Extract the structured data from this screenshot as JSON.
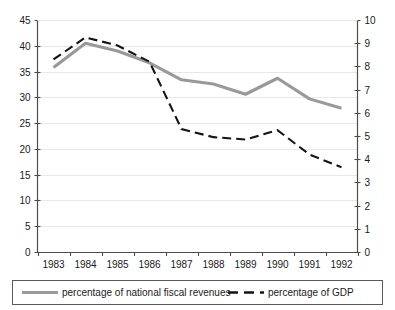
{
  "chart_data": {
    "type": "line",
    "title": "",
    "subtitle": "",
    "xlabel": "",
    "ylabel": "",
    "categories": [
      "1983",
      "1984",
      "1985",
      "1986",
      "1987",
      "1988",
      "1989",
      "1990",
      "1991",
      "1992"
    ],
    "grid": true,
    "legend_position": "bottom",
    "axes": {
      "left": {
        "label": "",
        "ylim": [
          0,
          45
        ],
        "tick_step": 5,
        "ticks": [
          "0",
          "5",
          "10",
          "15",
          "20",
          "25",
          "30",
          "35",
          "40",
          "45"
        ]
      },
      "right": {
        "label": "",
        "ylim": [
          0,
          10
        ],
        "tick_step": 1,
        "ticks": [
          "0",
          "1",
          "2",
          "3",
          "4",
          "5",
          "6",
          "7",
          "8",
          "9",
          "10"
        ]
      }
    },
    "series": [
      {
        "name": "percentage of national fiscal revenues",
        "axis": "left",
        "style": "solid",
        "color": "#999999",
        "values": [
          35.8,
          40.5,
          39.0,
          36.7,
          33.4,
          32.6,
          30.6,
          33.7,
          29.7,
          27.9
        ]
      },
      {
        "name": "percentage of GDP",
        "axis": "right",
        "style": "dashed",
        "color": "#141414",
        "values": [
          8.3,
          9.25,
          8.9,
          8.2,
          5.3,
          4.95,
          4.85,
          5.25,
          4.2,
          3.65
        ]
      }
    ]
  },
  "legend": {
    "entries": [
      {
        "label": "percentage of national fiscal revenues",
        "swatch": "solid-gray-line-icon"
      },
      {
        "label": "percentage of GDP",
        "swatch": "dashed-black-line-icon"
      }
    ]
  }
}
